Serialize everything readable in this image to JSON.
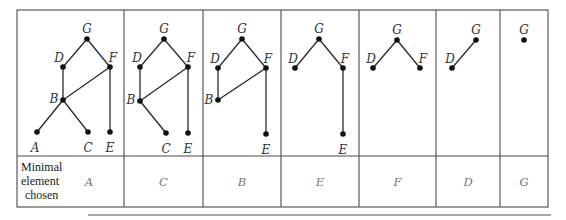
{
  "table": {
    "row_label_lines": [
      "Minimal",
      "element",
      "chosen"
    ],
    "columns": [
      {
        "chosen": "A",
        "nodes": [
          {
            "id": "G",
            "x": 87,
            "y": 39,
            "lx": 87,
            "ly": 29,
            "anchor": "middle"
          },
          {
            "id": "D",
            "x": 63,
            "y": 67,
            "lx": 59,
            "ly": 58,
            "anchor": "middle"
          },
          {
            "id": "F",
            "x": 110,
            "y": 67,
            "lx": 113,
            "ly": 58,
            "anchor": "middle"
          },
          {
            "id": "B",
            "x": 63,
            "y": 100,
            "lx": 54,
            "ly": 99,
            "anchor": "middle"
          },
          {
            "id": "A",
            "x": 37,
            "y": 132,
            "lx": 35,
            "ly": 148,
            "anchor": "middle"
          },
          {
            "id": "C",
            "x": 88,
            "y": 132,
            "lx": 88,
            "ly": 148,
            "anchor": "middle"
          },
          {
            "id": "E",
            "x": 110,
            "y": 132,
            "lx": 110,
            "ly": 148,
            "anchor": "middle"
          }
        ],
        "edges": [
          [
            "G",
            "D"
          ],
          [
            "G",
            "F"
          ],
          [
            "D",
            "B"
          ],
          [
            "F",
            "B"
          ],
          [
            "F",
            "E"
          ],
          [
            "B",
            "A"
          ],
          [
            "B",
            "C"
          ]
        ]
      },
      {
        "chosen": "C",
        "nodes": [
          {
            "id": "G",
            "x": 164,
            "y": 39,
            "lx": 164,
            "ly": 29,
            "anchor": "middle"
          },
          {
            "id": "D",
            "x": 140,
            "y": 67,
            "lx": 137,
            "ly": 58,
            "anchor": "middle"
          },
          {
            "id": "F",
            "x": 188,
            "y": 67,
            "lx": 191,
            "ly": 58,
            "anchor": "middle"
          },
          {
            "id": "B",
            "x": 140,
            "y": 101,
            "lx": 131,
            "ly": 100,
            "anchor": "middle"
          },
          {
            "id": "C",
            "x": 166,
            "y": 133,
            "lx": 166,
            "ly": 149,
            "anchor": "middle"
          },
          {
            "id": "E",
            "x": 188,
            "y": 133,
            "lx": 188,
            "ly": 149,
            "anchor": "middle"
          }
        ],
        "edges": [
          [
            "G",
            "D"
          ],
          [
            "G",
            "F"
          ],
          [
            "D",
            "B"
          ],
          [
            "F",
            "B"
          ],
          [
            "F",
            "E"
          ],
          [
            "B",
            "C"
          ]
        ]
      },
      {
        "chosen": "B",
        "nodes": [
          {
            "id": "G",
            "x": 242,
            "y": 39,
            "lx": 242,
            "ly": 29,
            "anchor": "middle"
          },
          {
            "id": "D",
            "x": 218,
            "y": 68,
            "lx": 215,
            "ly": 59,
            "anchor": "middle"
          },
          {
            "id": "F",
            "x": 266,
            "y": 68,
            "lx": 268,
            "ly": 59,
            "anchor": "middle"
          },
          {
            "id": "B",
            "x": 218,
            "y": 100,
            "lx": 209,
            "ly": 100,
            "anchor": "middle"
          },
          {
            "id": "E",
            "x": 266,
            "y": 134,
            "lx": 266,
            "ly": 150,
            "anchor": "middle"
          }
        ],
        "edges": [
          [
            "G",
            "D"
          ],
          [
            "G",
            "F"
          ],
          [
            "D",
            "B"
          ],
          [
            "F",
            "B"
          ],
          [
            "F",
            "E"
          ]
        ]
      },
      {
        "chosen": "E",
        "nodes": [
          {
            "id": "G",
            "x": 319,
            "y": 39,
            "lx": 319,
            "ly": 29,
            "anchor": "middle"
          },
          {
            "id": "D",
            "x": 295,
            "y": 68,
            "lx": 293,
            "ly": 59,
            "anchor": "middle"
          },
          {
            "id": "F",
            "x": 343,
            "y": 68,
            "lx": 345,
            "ly": 59,
            "anchor": "middle"
          },
          {
            "id": "E",
            "x": 343,
            "y": 134,
            "lx": 343,
            "ly": 150,
            "anchor": "middle"
          }
        ],
        "edges": [
          [
            "G",
            "F"
          ],
          [
            "F",
            "E"
          ],
          [
            "G",
            "D"
          ]
        ]
      },
      {
        "chosen": "F",
        "nodes": [
          {
            "id": "G",
            "x": 397,
            "y": 40,
            "lx": 397,
            "ly": 30,
            "anchor": "middle"
          },
          {
            "id": "D",
            "x": 373,
            "y": 68,
            "lx": 371,
            "ly": 59,
            "anchor": "middle"
          },
          {
            "id": "F",
            "x": 420,
            "y": 68,
            "lx": 423,
            "ly": 59,
            "anchor": "middle"
          }
        ],
        "edges": [
          [
            "G",
            "D"
          ],
          [
            "G",
            "F"
          ]
        ]
      },
      {
        "chosen": "D",
        "nodes": [
          {
            "id": "G",
            "x": 476,
            "y": 40,
            "lx": 476,
            "ly": 30,
            "anchor": "middle"
          },
          {
            "id": "D",
            "x": 452,
            "y": 68,
            "lx": 450,
            "ly": 59,
            "anchor": "middle"
          }
        ],
        "edges": [
          [
            "G",
            "D"
          ]
        ]
      },
      {
        "chosen": "G",
        "nodes": [
          {
            "id": "G",
            "x": 524,
            "y": 40,
            "lx": 524,
            "ly": 30,
            "anchor": "middle"
          }
        ],
        "edges": []
      }
    ]
  },
  "layout": {
    "col_bounds": [
      17,
      124,
      203,
      281,
      359,
      436,
      500,
      548
    ],
    "top": 10,
    "divider_y": 156,
    "bottom": 207,
    "rule": {
      "x1": 88,
      "x2": 551,
      "y": 215
    }
  },
  "colors": {
    "grid": "#4a4a4a",
    "edge": "#2a2a2a",
    "node": "#111111",
    "chosen_text": "#777777"
  }
}
